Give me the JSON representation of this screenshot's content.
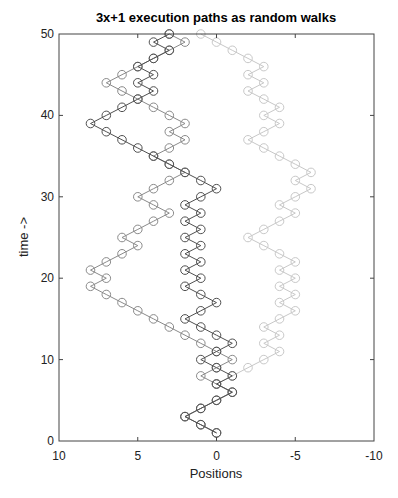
{
  "chart_data": {
    "type": "line",
    "title": "3x+1 execution paths as random walks",
    "xlabel": "Positions",
    "ylabel": "time ->",
    "xlim": [
      10,
      -10
    ],
    "ylim": [
      0,
      50
    ],
    "x_reversed": true,
    "grid": false,
    "legend": null,
    "marker": "open-circle",
    "x_ticks": [
      10,
      5,
      0,
      -5,
      -10
    ],
    "y_ticks": [
      0,
      10,
      20,
      30,
      40,
      50
    ],
    "x_tick_labels": [
      "10",
      "5",
      "0",
      "-5",
      "-10"
    ],
    "y_tick_labels": [
      "0",
      "10",
      "20",
      "30",
      "40",
      "50"
    ],
    "time": [
      1,
      2,
      3,
      4,
      5,
      6,
      7,
      8,
      9,
      10,
      11,
      12,
      13,
      14,
      15,
      16,
      17,
      18,
      19,
      20,
      21,
      22,
      23,
      24,
      25,
      26,
      27,
      28,
      29,
      30,
      31,
      32,
      33,
      34,
      35,
      36,
      37,
      38,
      39,
      40,
      41,
      42,
      43,
      44,
      45,
      46,
      47,
      48,
      49,
      50
    ],
    "series": [
      {
        "name": "path-light",
        "color": "#c8c8c8",
        "positions": [
          0,
          1,
          2,
          1,
          0,
          -1,
          0,
          -1,
          -2,
          -3,
          -4,
          -3,
          -4,
          -3,
          -4,
          -5,
          -4,
          -5,
          -4,
          -5,
          -4,
          -5,
          -4,
          -3,
          -2,
          -3,
          -4,
          -5,
          -4,
          -5,
          -6,
          -5,
          -6,
          -5,
          -4,
          -3,
          -2,
          -3,
          -4,
          -3,
          -4,
          -3,
          -2,
          -3,
          -2,
          -3,
          -2,
          -1,
          0,
          1
        ]
      },
      {
        "name": "path-medium",
        "color": "#8a8a8a",
        "positions": [
          0,
          1,
          2,
          1,
          0,
          -1,
          0,
          1,
          0,
          -1,
          0,
          1,
          2,
          3,
          4,
          5,
          6,
          7,
          8,
          7,
          8,
          7,
          6,
          5,
          6,
          5,
          4,
          3,
          4,
          5,
          4,
          3,
          2,
          3,
          4,
          3,
          2,
          3,
          2,
          3,
          4,
          5,
          6,
          7,
          6,
          5,
          4,
          3,
          2,
          3
        ]
      },
      {
        "name": "path-dark",
        "color": "#505050",
        "positions": [
          0,
          1,
          2,
          1,
          0,
          -1,
          0,
          -1,
          0,
          1,
          0,
          -1,
          0,
          1,
          2,
          1,
          0,
          1,
          2,
          1,
          2,
          1,
          2,
          1,
          2,
          1,
          2,
          1,
          2,
          1,
          0,
          1,
          2,
          3,
          4,
          5,
          6,
          7,
          8,
          7,
          6,
          5,
          4,
          5,
          4,
          5,
          4,
          3,
          4,
          3
        ]
      }
    ]
  }
}
